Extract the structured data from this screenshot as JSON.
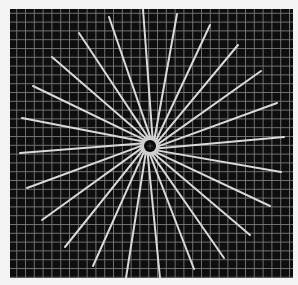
{
  "figure": {
    "panel": {
      "x": 10,
      "y": 9,
      "width": 283,
      "height": 269
    },
    "colors": {
      "page_background": "#f3f3f3",
      "panel_background": "#0e0e0e",
      "grid_line": "#7a7a7a",
      "ray": "#d9d9d9",
      "center_halo": "#cfcfcf",
      "center_hole": "#0a0a0a"
    },
    "grid": {
      "spacing": 8.8,
      "offset_x": 16.7,
      "offset_y": 13.3,
      "line_width": 0.9
    },
    "center": {
      "x": 150,
      "y": 146,
      "hole_radius": 6,
      "halo_radius": 10
    },
    "ray_width": 2,
    "rays": [
      {
        "x": 22,
        "y": 118
      },
      {
        "x": 33,
        "y": 86
      },
      {
        "x": 52,
        "y": 57
      },
      {
        "x": 79,
        "y": 33
      },
      {
        "x": 109,
        "y": 17
      },
      {
        "x": 143,
        "y": 9
      },
      {
        "x": 177,
        "y": 14
      },
      {
        "x": 210,
        "y": 25
      },
      {
        "x": 238,
        "y": 45
      },
      {
        "x": 261,
        "y": 71
      },
      {
        "x": 277,
        "y": 103
      },
      {
        "x": 284,
        "y": 137
      },
      {
        "x": 281,
        "y": 172
      },
      {
        "x": 270,
        "y": 206
      },
      {
        "x": 250,
        "y": 235
      },
      {
        "x": 224,
        "y": 258
      },
      {
        "x": 194,
        "y": 269
      },
      {
        "x": 160,
        "y": 278
      },
      {
        "x": 126,
        "y": 278
      },
      {
        "x": 93,
        "y": 266
      },
      {
        "x": 65,
        "y": 247
      },
      {
        "x": 42,
        "y": 220
      },
      {
        "x": 27,
        "y": 188
      },
      {
        "x": 20,
        "y": 153
      }
    ]
  }
}
